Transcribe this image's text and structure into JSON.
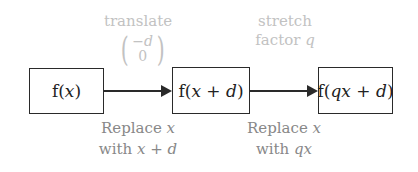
{
  "colors": {
    "box_border": "#2a2a2a",
    "arrow": "#2a2a2a",
    "top_label": "#c2c2c2",
    "bottom_label": "#888888"
  },
  "boxes": [
    {
      "label": "f(x)",
      "parts": [
        "f(",
        "x",
        ")"
      ]
    },
    {
      "label": "f(x + d)",
      "parts": [
        "f(",
        "x",
        " + ",
        "d",
        ")"
      ]
    },
    {
      "label": "f(qx + d)",
      "parts": [
        "f(",
        "qx",
        " + ",
        "d",
        ")"
      ]
    }
  ],
  "transitions": [
    {
      "top_line1": "translate",
      "matrix": {
        "top": "−d",
        "bottom": "0"
      },
      "bottom_line1_text": "Replace ",
      "bottom_line1_var": "x",
      "bottom_line2_text": "with ",
      "bottom_line2_expr": "x + d"
    },
    {
      "top_line1": "stretch",
      "top_line2_text": "factor ",
      "top_line2_var": "q",
      "bottom_line1_text": "Replace ",
      "bottom_line1_var": "x",
      "bottom_line2_text": "with ",
      "bottom_line2_expr": "qx"
    }
  ]
}
